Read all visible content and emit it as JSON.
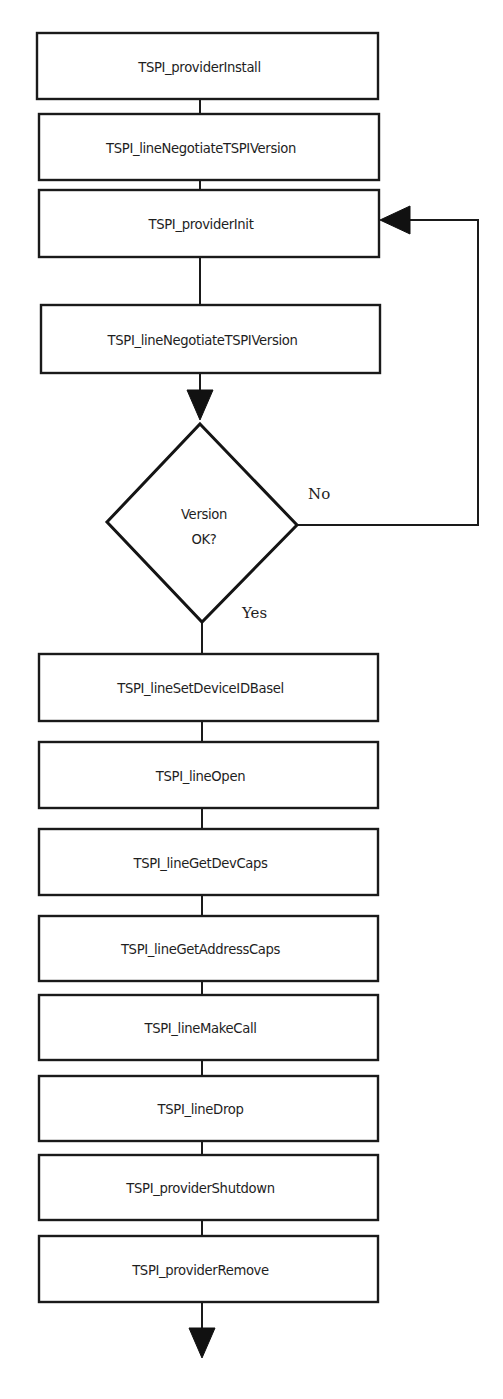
{
  "diagram": {
    "type": "flowchart",
    "stroke_color": "#1a1a1a",
    "background": "#ffffff",
    "boxes": [
      {
        "id": "b1",
        "label": "TSPI_providerInstall",
        "x": 37,
        "y": 33,
        "w": 341,
        "h": 66
      },
      {
        "id": "b2",
        "label": "TSPI_lineNegotiateTSPIVersion",
        "x": 39,
        "y": 114,
        "w": 340,
        "h": 66
      },
      {
        "id": "b3",
        "label": "TSPI_providerInit",
        "x": 39,
        "y": 190,
        "w": 340,
        "h": 67
      },
      {
        "id": "b4",
        "label": "TSPI_lineNegotiateTSPIVersion",
        "x": 41,
        "y": 305,
        "w": 339,
        "h": 68
      },
      {
        "id": "b5",
        "label": "TSPI_lineSetDeviceIDBasel",
        "x": 39,
        "y": 654,
        "w": 339,
        "h": 67
      },
      {
        "id": "b6",
        "label": "TSPI_lineOpen",
        "x": 39,
        "y": 742,
        "w": 339,
        "h": 66
      },
      {
        "id": "b7",
        "label": "TSPI_lineGetDevCaps",
        "x": 39,
        "y": 829,
        "w": 339,
        "h": 66
      },
      {
        "id": "b8",
        "label": "TSPI_lineGetAddressCaps",
        "x": 39,
        "y": 916,
        "w": 339,
        "h": 65
      },
      {
        "id": "b9",
        "label": "TSPI_lineMakeCall",
        "x": 39,
        "y": 995,
        "w": 339,
        "h": 65
      },
      {
        "id": "b10",
        "label": "TSPI_lineDrop",
        "x": 39,
        "y": 1076,
        "w": 339,
        "h": 65
      },
      {
        "id": "b11",
        "label": "TSPI_providerShutdown",
        "x": 39,
        "y": 1155,
        "w": 339,
        "h": 65
      },
      {
        "id": "b12",
        "label": "TSPI_providerRemove",
        "x": 39,
        "y": 1236,
        "w": 339,
        "h": 66
      }
    ],
    "decision": {
      "line1": "Version",
      "line2": "OK?",
      "points": {
        "top": [
          200,
          424
        ],
        "right": [
          297,
          525
        ],
        "bottom": [
          202,
          622
        ],
        "left": [
          107,
          522
        ]
      },
      "yes_label": "Yes",
      "no_label": "No"
    },
    "edges": [
      {
        "from": "b1",
        "to": "b2",
        "points": [
          [
            200,
            99
          ],
          [
            200,
            114
          ]
        ]
      },
      {
        "from": "b2",
        "to": "b3",
        "points": [
          [
            200,
            180
          ],
          [
            200,
            190
          ]
        ]
      },
      {
        "from": "b3",
        "to": "b4",
        "points": [
          [
            200,
            257
          ],
          [
            200,
            305
          ]
        ]
      },
      {
        "from": "b4",
        "to": "decision",
        "points": [
          [
            200,
            373
          ],
          [
            200,
            395
          ]
        ],
        "arrow": "down",
        "arrow_tip": [
          200,
          420
        ]
      },
      {
        "from": "decision",
        "to": "b3",
        "label": "No",
        "points": [
          [
            297,
            525
          ],
          [
            478,
            525
          ],
          [
            478,
            220
          ],
          [
            405,
            220
          ]
        ],
        "arrow": "left",
        "arrow_tip": [
          380,
          220
        ]
      },
      {
        "from": "decision",
        "to": "b5",
        "label": "Yes",
        "points": [
          [
            202,
            622
          ],
          [
            202,
            654
          ]
        ]
      },
      {
        "from": "b5",
        "to": "b6",
        "points": [
          [
            202,
            721
          ],
          [
            202,
            742
          ]
        ]
      },
      {
        "from": "b6",
        "to": "b7",
        "points": [
          [
            202,
            808
          ],
          [
            202,
            829
          ]
        ]
      },
      {
        "from": "b7",
        "to": "b8",
        "points": [
          [
            202,
            895
          ],
          [
            202,
            916
          ]
        ]
      },
      {
        "from": "b8",
        "to": "b9",
        "points": [
          [
            202,
            981
          ],
          [
            202,
            995
          ]
        ]
      },
      {
        "from": "b9",
        "to": "b10",
        "points": [
          [
            202,
            1060
          ],
          [
            202,
            1076
          ]
        ]
      },
      {
        "from": "b10",
        "to": "b11",
        "points": [
          [
            202,
            1141
          ],
          [
            202,
            1155
          ]
        ]
      },
      {
        "from": "b11",
        "to": "b12",
        "points": [
          [
            202,
            1220
          ],
          [
            202,
            1236
          ]
        ]
      },
      {
        "from": "b12",
        "to": "end",
        "points": [
          [
            202,
            1302
          ],
          [
            202,
            1330
          ]
        ],
        "arrow": "down",
        "arrow_tip": [
          202,
          1358
        ]
      }
    ]
  }
}
